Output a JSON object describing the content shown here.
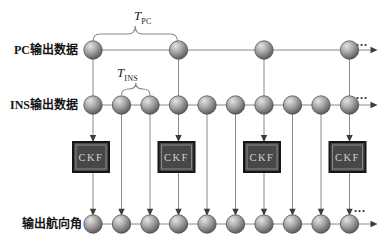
{
  "figure": {
    "bg": "#ffffff",
    "node_radius": 9.2,
    "rows": [
      {
        "name": "pc",
        "label": "PC输出数据",
        "y": 50,
        "nodes": [
          93,
          178.5,
          264,
          349.5
        ],
        "ellipsis": {
          "x": 356,
          "y": 46
        }
      },
      {
        "name": "ins",
        "label": "INS输出数据",
        "y": 105,
        "nodes": [
          93,
          121.5,
          150,
          178.5,
          207,
          235.5,
          264,
          292.5,
          321,
          349.5
        ],
        "ellipsis": {
          "x": 356,
          "y": 99
        }
      },
      {
        "name": "output",
        "label": "输出航向角",
        "y": 224,
        "nodes": [
          93,
          121.5,
          150,
          178.5,
          207,
          235.5,
          264,
          292.5,
          321,
          349.5
        ],
        "ellipsis": {
          "x": 354,
          "y": 212
        }
      }
    ],
    "ellipsis_text": "...",
    "pc_columns": [
      93,
      178.5,
      264,
      349.5
    ],
    "ckf": {
      "label": "CKF",
      "centers": [
        91,
        176.5,
        262,
        347.5
      ],
      "top": 142,
      "width": 36,
      "height": 30
    },
    "braces": [
      {
        "label_main": "T",
        "label_sub": "PC",
        "x1": 93,
        "x2": 177.5,
        "tip_y": 26,
        "end_y": 42
      },
      {
        "label_main": "T",
        "label_sub": "INS",
        "x1": 121.5,
        "x2": 150,
        "tip_y": 83,
        "end_y": 95
      }
    ],
    "line_end_x": 371,
    "arrow_tip_x": 377.5,
    "colors": {
      "line": "#8a8a8a",
      "arrow": "#3d3d3d",
      "node_edge": "#4f4f4f",
      "node_mid": "#a6a6a6",
      "node_hi": "#e4e4e4",
      "box_fill": "#474747",
      "box_border": "#161616",
      "box_bevel": "#8f8f8f",
      "box_text": "#d2d2d2",
      "label_text": "#151515",
      "ellipsis_color": "#2a2a2a"
    }
  }
}
